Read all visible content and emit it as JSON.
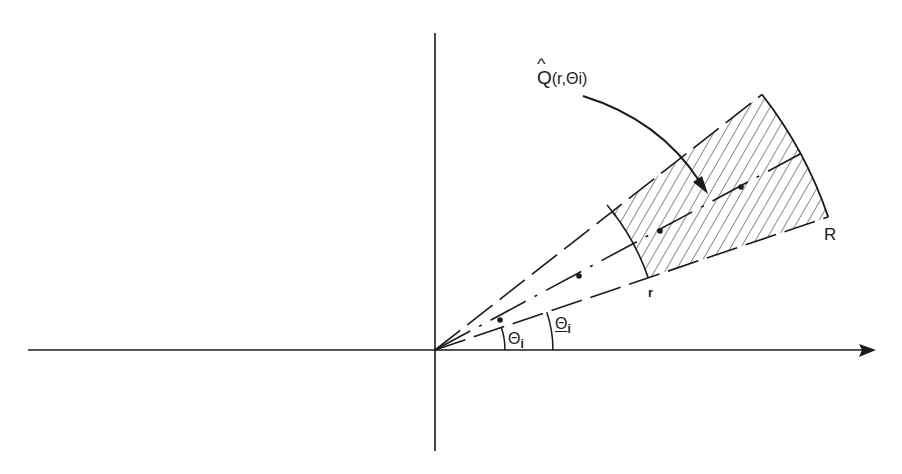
{
  "diagram": {
    "title": "",
    "type": "polar-sector",
    "colors": {
      "ink": "#1a1a1a",
      "background": "#ffffff"
    },
    "origin": {
      "x": 435,
      "y": 350
    },
    "axes": {
      "horizontal": {
        "from_x": 28,
        "to_x": 875,
        "y": 350,
        "arrow": "right"
      },
      "vertical": {
        "x": 435,
        "from_y": 33,
        "to_y": 451,
        "arrow": "none"
      }
    },
    "rays": [
      {
        "name": "upper-boundary",
        "angle_deg": 38.0,
        "style": "long-dash"
      },
      {
        "name": "center",
        "angle_deg": 28.2,
        "style": "dash-dot"
      },
      {
        "name": "lower-boundary",
        "angle_deg": 18.7,
        "style": "long-dash"
      }
    ],
    "inner_radius": 225,
    "outer_radius": 415,
    "hatched_region": "annular sector between r and R",
    "dots": [
      {
        "x": 500,
        "y": 320
      },
      {
        "x": 579,
        "y": 276
      },
      {
        "x": 660,
        "y": 231
      },
      {
        "x": 741,
        "y": 187
      }
    ],
    "angle_arcs": [
      {
        "name": "theta-i",
        "radius": 70
      },
      {
        "name": "theta-i-underline",
        "radius": 118
      }
    ]
  },
  "labels": {
    "region": {
      "symbol": "Q",
      "suffix": "(r,Θi)"
    },
    "outer_radius": "R",
    "inner_radius": "r",
    "angle_small": {
      "symbol": "Θ",
      "sub": "i"
    },
    "angle_large": {
      "symbol": "Θ",
      "sub": "i"
    }
  }
}
